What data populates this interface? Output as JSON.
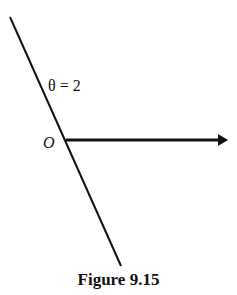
{
  "figure": {
    "caption": "Figure 9.15",
    "angle_label": "θ = 2",
    "origin_label": "O",
    "colors": {
      "stroke": "#111111",
      "background": "#ffffff"
    }
  }
}
